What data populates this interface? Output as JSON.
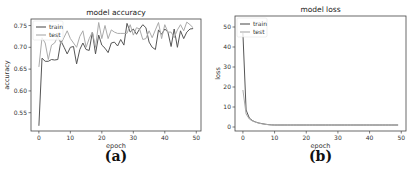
{
  "chart_data": [
    {
      "type": "line",
      "title": "model accuracy",
      "xlabel": "epoch",
      "ylabel": "accuracy",
      "caption": "(a)",
      "xlim": [
        -2.5,
        51.5
      ],
      "ylim": [
        0.508,
        0.765
      ],
      "xticks": [
        0,
        10,
        20,
        30,
        40,
        50
      ],
      "yticks": [
        0.55,
        0.6,
        0.65,
        0.7,
        0.75
      ],
      "ytick_labels": [
        "0.55",
        "0.60",
        "0.65",
        "0.70",
        "0.75"
      ],
      "grid": false,
      "legend_position": "upper left",
      "x": [
        0,
        1,
        2,
        3,
        4,
        5,
        6,
        7,
        8,
        9,
        10,
        11,
        12,
        13,
        14,
        15,
        16,
        17,
        18,
        19,
        20,
        21,
        22,
        23,
        24,
        25,
        26,
        27,
        28,
        29,
        30,
        31,
        32,
        33,
        34,
        35,
        36,
        37,
        38,
        39,
        40,
        41,
        42,
        43,
        44,
        45,
        46,
        47,
        48,
        49
      ],
      "series": [
        {
          "name": "train",
          "color": "#555555",
          "values": [
            0.52,
            0.675,
            0.668,
            0.668,
            0.672,
            0.671,
            0.672,
            0.715,
            0.7,
            0.685,
            0.7,
            0.702,
            0.662,
            0.695,
            0.71,
            0.695,
            0.693,
            0.735,
            0.685,
            0.728,
            0.705,
            0.698,
            0.688,
            0.71,
            0.712,
            0.703,
            0.718,
            0.705,
            0.755,
            0.735,
            0.742,
            0.73,
            0.742,
            0.752,
            0.745,
            0.712,
            0.7,
            0.695,
            0.74,
            0.73,
            0.742,
            0.735,
            0.702,
            0.742,
            0.7,
            0.738,
            0.72,
            0.735,
            0.742,
            0.743
          ]
        },
        {
          "name": "test",
          "color": "#aaaaaa",
          "values": [
            0.655,
            0.722,
            0.71,
            0.672,
            0.705,
            0.71,
            0.725,
            0.708,
            0.723,
            0.738,
            0.72,
            0.71,
            0.7,
            0.725,
            0.738,
            0.7,
            0.72,
            0.735,
            0.7,
            0.757,
            0.72,
            0.75,
            0.72,
            0.74,
            0.735,
            0.732,
            0.732,
            0.732,
            0.732,
            0.752,
            0.728,
            0.745,
            0.742,
            0.718,
            0.72,
            0.738,
            0.722,
            0.74,
            0.757,
            0.72,
            0.752,
            0.735,
            0.735,
            0.722,
            0.74,
            0.752,
            0.738,
            0.758,
            0.752,
            0.745
          ]
        }
      ]
    },
    {
      "type": "line",
      "title": "model loss",
      "xlabel": "epoch",
      "ylabel": "loss",
      "caption": "(b)",
      "xlim": [
        -2.5,
        51.5
      ],
      "ylim": [
        -2,
        55.5
      ],
      "xticks": [
        0,
        10,
        20,
        30,
        40,
        50
      ],
      "yticks": [
        0,
        10,
        20,
        30,
        40,
        50
      ],
      "ytick_labels": [
        "0",
        "10",
        "20",
        "30",
        "40",
        "50"
      ],
      "grid": false,
      "legend_position": "upper left",
      "x": [
        0,
        1,
        2,
        3,
        4,
        5,
        6,
        7,
        8,
        9,
        10,
        11,
        12,
        13,
        14,
        15,
        16,
        17,
        18,
        19,
        20,
        21,
        22,
        23,
        24,
        25,
        26,
        27,
        28,
        29,
        30,
        31,
        32,
        33,
        34,
        35,
        36,
        37,
        38,
        39,
        40,
        41,
        42,
        43,
        44,
        45,
        46,
        47,
        48,
        49
      ],
      "series": [
        {
          "name": "train",
          "color": "#555555",
          "values": [
            47,
            8.5,
            4.5,
            3.2,
            2.5,
            2.0,
            1.7,
            1.4,
            1.2,
            1.05,
            1.0,
            1.0,
            1.0,
            1.0,
            1.0,
            1.0,
            1.0,
            1.0,
            1.0,
            1.0,
            1.0,
            1.0,
            1.0,
            1.0,
            1.0,
            1.0,
            1.0,
            1.0,
            1.0,
            1.0,
            1.0,
            1.0,
            1.0,
            1.0,
            1.0,
            1.0,
            1.0,
            1.0,
            1.0,
            1.0,
            1.0,
            1.0,
            1.0,
            1.0,
            1.0,
            1.0,
            1.0,
            1.0,
            1.0,
            1.0
          ]
        },
        {
          "name": "test",
          "color": "#aaaaaa",
          "values": [
            18.5,
            6.5,
            4.0,
            3.0,
            2.4,
            1.9,
            1.6,
            1.35,
            1.15,
            1.05,
            1.0,
            1.0,
            1.0,
            1.0,
            1.0,
            1.0,
            1.0,
            1.0,
            1.0,
            1.0,
            1.0,
            1.0,
            1.0,
            1.0,
            1.0,
            1.0,
            1.0,
            1.0,
            1.0,
            1.0,
            1.0,
            1.0,
            1.0,
            1.0,
            1.0,
            1.0,
            1.0,
            1.0,
            1.0,
            1.0,
            1.0,
            1.0,
            1.0,
            1.0,
            1.0,
            1.0,
            1.0,
            1.0,
            1.0,
            1.0
          ]
        }
      ]
    }
  ],
  "layout": [
    {
      "frame": {
        "left": 31,
        "top": 19,
        "right": 201,
        "bottom": 131
      }
    },
    {
      "frame": {
        "left": 235,
        "top": 16,
        "right": 406,
        "bottom": 131
      }
    }
  ]
}
